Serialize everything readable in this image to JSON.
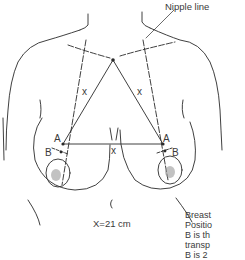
{
  "figure": {
    "title_annotation": "Nipple line",
    "labels": {
      "x_left": "x",
      "x_right": "x",
      "x_bottom": "x",
      "a_left": "A",
      "a_right": "A",
      "b_left": "B",
      "b_right": "B",
      "measurement": "X=21 cm"
    },
    "caption_lines": [
      "Breast",
      "Positio",
      "B is th",
      "transp",
      "B is 2"
    ],
    "colors": {
      "line": "#2a2a2a",
      "shade": "#9a9a9a",
      "background": "#ffffff"
    }
  }
}
